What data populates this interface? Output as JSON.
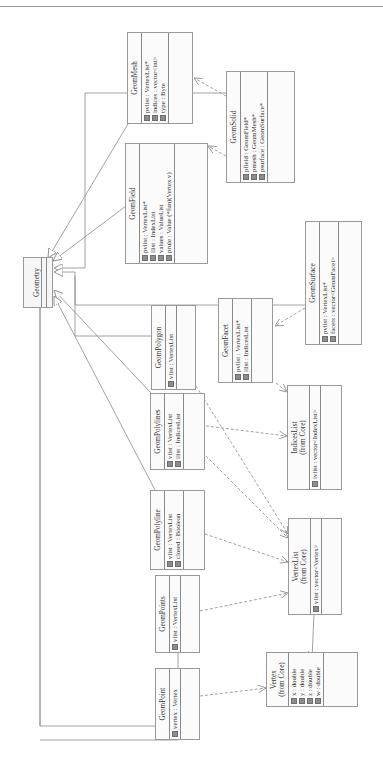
{
  "diagram": {
    "type": "UML class diagram",
    "orientation": "rotated 90° counter-clockwise",
    "classes": {
      "geometry": {
        "name": "Geometry"
      },
      "geom_mesh": {
        "name": "GeomMesh",
        "attributes": [
          "pvlist : VertexList*",
          "indices : vector<int>",
          "type : Byte"
        ]
      },
      "geom_solid": {
        "name": "GeomSolid",
        "attributes": [
          "pfield : GeomField*",
          "pmesh : GeomMesh*",
          "psurface : GeomSurface*"
        ]
      },
      "geom_field": {
        "name": "GeomField",
        "attributes": [
          "pvlist : VertexList*",
          "ilist : IndexList",
          "values : ValueList",
          "prule : Value (*fun)(Vertex v)"
        ]
      },
      "geom_surface": {
        "name": "GeomSurface",
        "attributes": [
          "pvlist : VertexList*",
          "facets : vector<GeomFacet>"
        ]
      },
      "geom_polygon": {
        "name": "GeomPolygon",
        "attributes": [
          "vlist : VertexList"
        ]
      },
      "geom_facet": {
        "name": "GeomFacet",
        "attributes": [
          "pvlist : VertexList*",
          "ilist : IndicesList"
        ]
      },
      "indices_list": {
        "name": "IndicesList",
        "package": "(from Core)",
        "attributes": [
          "ivlist : vector<IndexList>"
        ]
      },
      "geom_polylines": {
        "name": "GeomPolylines",
        "attributes": [
          "vlist : VertexList",
          "ilist : IndicesList"
        ]
      },
      "geom_polyline": {
        "name": "GeomPolyline",
        "attributes": [
          "vlist : VertexList",
          "closed : Boolean"
        ]
      },
      "vertex_list": {
        "name": "VertexList",
        "package": "(from Core)",
        "attributes": [
          "vlist : vector<Vertex>"
        ]
      },
      "geom_points": {
        "name": "GeomPoints",
        "attributes": [
          "vlist : VertexList"
        ]
      },
      "geom_point": {
        "name": "GeomPoint",
        "attributes": [
          "vertex : Vertex"
        ]
      },
      "vertex": {
        "name": "Vertex",
        "package": "(from Core)",
        "attributes": [
          "x : double",
          "y : double",
          "z : double",
          "w : double"
        ]
      }
    },
    "relationships": {
      "generalization_to_geometry": [
        "GeomMesh",
        "GeomField",
        "GeomSolid",
        "GeomSurface",
        "GeomPolygon",
        "GeomPolylines",
        "GeomPolyline",
        "GeomPoints",
        "GeomPoint"
      ],
      "dependencies": [
        [
          "GeomSolid",
          "GeomMesh"
        ],
        [
          "GeomSolid",
          "GeomField"
        ],
        [
          "GeomSurface",
          "GeomFacet"
        ],
        [
          "GeomFacet",
          "IndicesList"
        ],
        [
          "GeomPolylines",
          "IndicesList"
        ],
        [
          "GeomPolylines",
          "VertexList"
        ],
        [
          "GeomPolygon",
          "VertexList"
        ],
        [
          "GeomPolyline",
          "VertexList"
        ],
        [
          "GeomPoints",
          "VertexList"
        ],
        [
          "GeomPoint",
          "Vertex"
        ]
      ],
      "associations": [
        [
          "VertexList",
          "Vertex"
        ]
      ]
    },
    "colors": {
      "line": "#8a8a8a",
      "box_border": "#9a9a9a",
      "box_fill": "#fbfbfb",
      "attr_icon": "#8c8c8c"
    }
  }
}
